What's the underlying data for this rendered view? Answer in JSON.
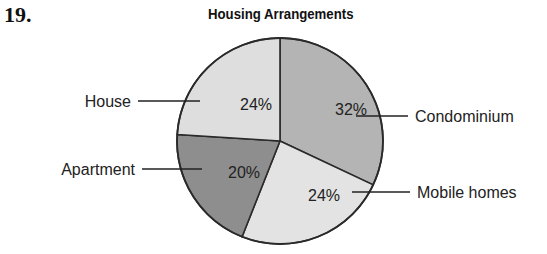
{
  "question_number": "19.",
  "chart_data": {
    "type": "pie",
    "title": "Housing Arrangements",
    "categories": [
      "Condominium",
      "Mobile homes",
      "Apartment",
      "House"
    ],
    "values": [
      32,
      24,
      20,
      24
    ],
    "value_labels": [
      "32%",
      "24%",
      "20%",
      "24%"
    ],
    "unit": "%",
    "start_angle_deg": 0,
    "direction": "clockwise",
    "colors": [
      "#b4b4b4",
      "#e3e3e3",
      "#8e8e8e",
      "#dedede"
    ],
    "legend": "none (leader-line labels)"
  }
}
